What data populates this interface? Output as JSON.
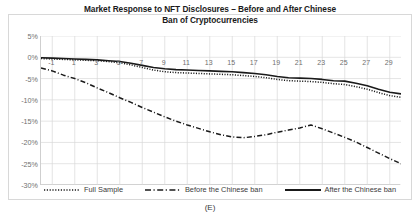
{
  "figure": {
    "caption": "(E)"
  },
  "chart_data": {
    "type": "line",
    "title": "Market Response to NFT Disclosures – Before and After Chinese Ban of Cryptocurrencies",
    "title_line1": "Market Response to NFT Disclosures – Before and After Chinese",
    "title_line2": "Ban of Cryptocurrencies",
    "xlabel": "",
    "ylabel": "",
    "xlim": [
      -2,
      30
    ],
    "ylim": [
      -30,
      5
    ],
    "grid": true,
    "legend_position": "bottom",
    "ytick_labels": [
      "5%",
      "0%",
      "-5%",
      "-10%",
      "-15%",
      "-20%",
      "-25%",
      "-30%"
    ],
    "ytick_values": [
      5,
      0,
      -5,
      -10,
      -15,
      -20,
      -25,
      -30
    ],
    "xtick_labels": [
      "-1",
      "1",
      "3",
      "5",
      "7",
      "9",
      "11",
      "13",
      "15",
      "17",
      "19",
      "21",
      "23",
      "25",
      "27",
      "29"
    ],
    "xtick_values": [
      -1,
      1,
      3,
      5,
      7,
      9,
      11,
      13,
      15,
      17,
      19,
      21,
      23,
      25,
      27,
      29
    ],
    "x": [
      -2,
      -1,
      0,
      1,
      2,
      3,
      4,
      5,
      6,
      7,
      8,
      9,
      10,
      11,
      12,
      13,
      14,
      15,
      16,
      17,
      18,
      19,
      20,
      21,
      22,
      23,
      24,
      25,
      26,
      27,
      28,
      29,
      30
    ],
    "series": [
      {
        "name": "Full Sample",
        "style": "dotted",
        "color": "#1a1a1a",
        "values": [
          -0.3,
          -0.4,
          -0.5,
          -0.6,
          -0.7,
          -0.8,
          -1.0,
          -1.3,
          -1.8,
          -2.4,
          -3.0,
          -3.4,
          -3.6,
          -3.7,
          -3.8,
          -3.9,
          -4.0,
          -4.1,
          -4.3,
          -4.5,
          -4.8,
          -5.2,
          -5.5,
          -5.6,
          -5.7,
          -5.9,
          -6.2,
          -6.4,
          -6.9,
          -7.5,
          -8.3,
          -9.0,
          -9.4
        ]
      },
      {
        "name": "Before the Chinese ban",
        "style": "dash-dot",
        "color": "#1a1a1a",
        "values": [
          -2.5,
          -3.2,
          -4.2,
          -5.0,
          -6.0,
          -7.2,
          -8.3,
          -9.5,
          -10.6,
          -11.8,
          -12.9,
          -14.0,
          -15.0,
          -15.9,
          -16.7,
          -17.5,
          -18.2,
          -18.7,
          -18.9,
          -18.6,
          -18.2,
          -17.6,
          -17.1,
          -16.6,
          -15.9,
          -16.8,
          -17.8,
          -18.8,
          -19.9,
          -21.2,
          -22.5,
          -23.8,
          -25.0
        ]
      },
      {
        "name": "After the Chinese ban",
        "style": "solid",
        "color": "#1a1a1a",
        "values": [
          -0.1,
          -0.2,
          -0.3,
          -0.4,
          -0.5,
          -0.6,
          -0.8,
          -1.0,
          -1.4,
          -1.9,
          -2.4,
          -2.7,
          -2.9,
          -3.0,
          -3.1,
          -3.2,
          -3.3,
          -3.4,
          -3.6,
          -3.8,
          -4.1,
          -4.5,
          -4.8,
          -4.9,
          -5.0,
          -5.2,
          -5.5,
          -5.6,
          -6.1,
          -6.7,
          -7.5,
          -8.2,
          -8.6
        ]
      }
    ],
    "legend": [
      {
        "label": "Full Sample",
        "style": "dotted"
      },
      {
        "label": "Before the Chinese ban",
        "style": "dash-dot"
      },
      {
        "label": "After the Chinese ban",
        "style": "solid"
      }
    ]
  }
}
